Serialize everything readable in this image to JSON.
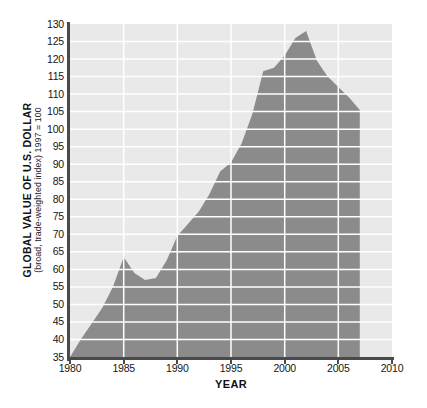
{
  "figure": {
    "y_axis_title": "GLOBAL VALUE OF U.S. DOLLAR",
    "y_axis_subtitle": "(broad, trade-weighted index) 1997 = 100",
    "x_axis_title": "YEAR"
  },
  "chart_data": {
    "type": "area",
    "title": "",
    "xlabel": "YEAR",
    "ylabel": "GLOBAL VALUE OF U.S. DOLLAR (broad, trade-weighted index) 1997 = 100",
    "xlim": [
      1980,
      2010
    ],
    "ylim": [
      35,
      130
    ],
    "x_ticks": [
      1980,
      1985,
      1990,
      1995,
      2000,
      2005,
      2010
    ],
    "y_ticks": [
      35,
      40,
      45,
      50,
      55,
      60,
      65,
      70,
      75,
      80,
      85,
      90,
      95,
      100,
      105,
      110,
      115,
      120,
      125,
      130
    ],
    "grid": {
      "horizontal_every": 5,
      "vertical_every": 5,
      "style": "white lines over plot and area"
    },
    "legend": "none",
    "series": [
      {
        "name": "Global value of U.S. dollar (broad, trade-weighted index, 1997 = 100)",
        "x": [
          1980,
          1981,
          1982,
          1983,
          1984,
          1985,
          1986,
          1987,
          1988,
          1989,
          1990,
          1991,
          1992,
          1993,
          1994,
          1995,
          1996,
          1997,
          1998,
          1999,
          2000,
          2001,
          2002,
          2003,
          2004,
          2005,
          2006,
          2007
        ],
        "y": [
          35,
          40,
          44.5,
          49,
          55,
          63.5,
          59,
          57,
          57.5,
          62.5,
          69.5,
          73,
          76.5,
          81.5,
          88,
          90.5,
          96,
          104.5,
          116.5,
          117.5,
          121,
          126,
          128,
          119.5,
          115,
          112,
          109,
          105.5
        ]
      }
    ],
    "annotations": [
      "data ends at 2007 with vertical right edge of shaded area"
    ],
    "colors": {
      "area_fill": "#8b8b8b",
      "plot_background": "#e9e9e9",
      "gridline": "#ffffff",
      "axis": "#4a4a4a",
      "tick_text": "#161616"
    }
  }
}
